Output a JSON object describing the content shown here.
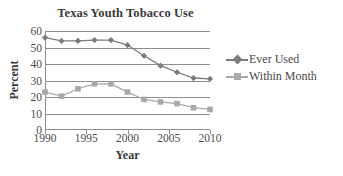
{
  "chart_data": {
    "type": "line",
    "title": "Texas Youth Tobacco Use",
    "xlabel": "Year",
    "ylabel": "Percent",
    "x": [
      1990,
      1992,
      1994,
      1996,
      1998,
      2000,
      2002,
      2004,
      2006,
      2008,
      2010
    ],
    "xlim": [
      1990,
      2010
    ],
    "ylim": [
      0,
      60
    ],
    "xticks": [
      1990,
      1995,
      2000,
      2005,
      2010
    ],
    "xtick_labels": [
      "1990",
      "1995",
      "2000",
      "2005",
      "2010"
    ],
    "yticks": [
      0,
      10,
      20,
      30,
      40,
      50,
      60
    ],
    "ytick_labels": [
      "0",
      "10",
      "20",
      "30",
      "40",
      "50",
      "60"
    ],
    "grid": true,
    "grid_axis": "y",
    "legend_position": "right",
    "series": [
      {
        "name": "Ever Used",
        "marker": "diamond",
        "color": "#7b7b7b",
        "values": [
          56,
          54,
          54,
          54.5,
          54.5,
          51.5,
          45,
          39,
          35,
          31.5,
          31
        ]
      },
      {
        "name": "Within Month",
        "marker": "square",
        "color": "#a9a9a9",
        "values": [
          23,
          20.5,
          25,
          28,
          28,
          23,
          18.5,
          17,
          16,
          13.5,
          12.5
        ]
      }
    ]
  }
}
